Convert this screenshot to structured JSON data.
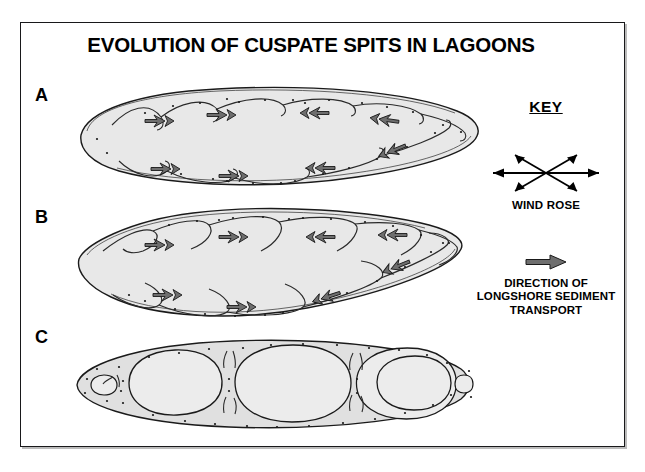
{
  "figure": {
    "title": "EVOLUTION OF CUSPATE SPITS IN LAGOONS",
    "panels": [
      {
        "label": "A",
        "name": "panel-a-early-stage",
        "description": "Elongated lagoon with small incipient cuspate spits along both shores; longshore transport arrows point left on the western half and right on the eastern half."
      },
      {
        "label": "B",
        "name": "panel-b-intermediate-stage",
        "description": "Lagoon with well developed cuspate spits extending further into the water body; longshore transport arrows point left on the western half and right on the eastern half."
      },
      {
        "label": "C",
        "name": "panel-c-final-stage",
        "description": "Spits have joined across the lagoon, isolating four large circular ponds plus a small pool at each end."
      }
    ]
  },
  "key": {
    "title": "KEY",
    "wind_rose_icon": "wind-rose-icon",
    "wind_rose_label": "WIND ROSE",
    "transport_arrow_icon": "longshore-transport-arrow-icon",
    "transport_label_lines": [
      "DIRECTION OF",
      "LONGSHORE SEDIMENT",
      "TRANSPORT"
    ],
    "transport_label_line1": "DIRECTION OF",
    "transport_label_line2": "LONGSHORE SEDIMENT",
    "transport_label_line3": "TRANSPORT"
  },
  "colors": {
    "lagoon_fill": "#e8e8e8",
    "pond_fill": "#ececec",
    "outline": "#1a1a1a",
    "arrow_fill": "#6e6e6e",
    "arrow_stroke": "#1a1a1a",
    "frame": "#18181a",
    "background": "#ffffff",
    "text": "#000000"
  }
}
